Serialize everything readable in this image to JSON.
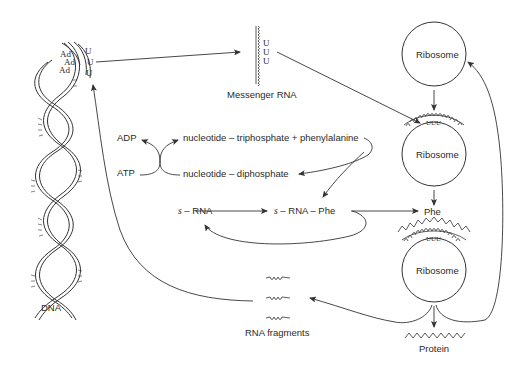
{
  "diagram": {
    "type": "protein-synthesis-flow",
    "nodes": {
      "dna": {
        "label": "DNA",
        "bases": [
          "Ad",
          "Ad",
          "Ad"
        ],
        "complement": [
          "U",
          "U",
          "U"
        ]
      },
      "mrna": {
        "label": "Messenger RNA",
        "codon": [
          "U",
          "U",
          "U"
        ]
      },
      "ribosome_top": {
        "label": "Ribosome"
      },
      "ribosome_mid": {
        "label": "Ribosome",
        "codon": "UUU"
      },
      "ribosome_bottom": {
        "label": "Ribosome",
        "codon": "UUU"
      },
      "adp": {
        "label": "ADP"
      },
      "atp": {
        "label": "ATP"
      },
      "ntp": {
        "label": "nucleotide – triphosphate + phenylalanine"
      },
      "ndp": {
        "label": "nucleotide – diphosphate"
      },
      "srna": {
        "prefix": "s",
        "label": "– RNA"
      },
      "srna_phe": {
        "prefix": "s",
        "label": "– RNA – Phe"
      },
      "phe": {
        "label": "Phe"
      },
      "protein": {
        "label": "Protein"
      },
      "fragments": {
        "label": "RNA fragments"
      }
    },
    "edges": [
      {
        "from": "dna",
        "to": "mrna"
      },
      {
        "from": "mrna",
        "to": "ribosome_mid"
      },
      {
        "from": "ribosome_top",
        "to": "ribosome_mid"
      },
      {
        "from": "ribosome_mid",
        "to": "phe"
      },
      {
        "from": "atp",
        "to": "adp"
      },
      {
        "from": "ntp",
        "to": "ndp"
      },
      {
        "from": "ntp",
        "to": "srna_phe"
      },
      {
        "from": "srna",
        "to": "srna_phe"
      },
      {
        "from": "srna_phe",
        "to": "srna"
      },
      {
        "from": "srna_phe",
        "to": "phe"
      },
      {
        "from": "ribosome_bottom",
        "to": "protein"
      },
      {
        "from": "ribosome_bottom",
        "to": "ribosome_top"
      },
      {
        "from": "ribosome_bottom",
        "to": "fragments"
      },
      {
        "from": "fragments",
        "to": "dna"
      }
    ]
  }
}
